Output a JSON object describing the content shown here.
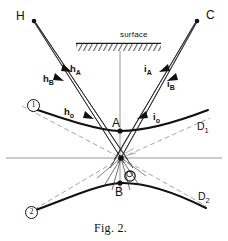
{
  "figure": {
    "caption": "Fig. 2.",
    "surface_label": "surface",
    "points": [
      {
        "id": "H",
        "label": "H",
        "x": 30,
        "y": 17
      },
      {
        "id": "C",
        "label": "C",
        "x": 206,
        "y": 16
      },
      {
        "id": "A",
        "label": "A",
        "x": 121,
        "y": 124
      },
      {
        "id": "B",
        "label": "B",
        "x": 120,
        "y": 191
      },
      {
        "id": "O",
        "label": "O",
        "x": 130,
        "y": 176
      },
      {
        "id": "D1",
        "label": "D",
        "sub": "1",
        "x": 200,
        "y": 128
      },
      {
        "id": "D2",
        "label": "D",
        "sub": "2",
        "x": 201,
        "y": 198
      }
    ],
    "ray_labels": [
      {
        "id": "hA",
        "label": "h",
        "sub": "A",
        "x": 71,
        "y": 71
      },
      {
        "id": "hB",
        "label": "h",
        "sub": "B",
        "x": 45,
        "y": 80
      },
      {
        "id": "ho",
        "label": "h",
        "sub": "o",
        "x": 66,
        "y": 112
      },
      {
        "id": "iA",
        "label": "i",
        "sub": "A",
        "x": 145,
        "y": 71
      },
      {
        "id": "iB",
        "label": "i",
        "sub": "B",
        "x": 168,
        "y": 84
      },
      {
        "id": "io",
        "label": "i",
        "sub": "o",
        "x": 155,
        "y": 117
      }
    ],
    "branch_markers": [
      {
        "id": "branch-1",
        "label": "1",
        "x": 27,
        "y": 101
      },
      {
        "id": "branch-2",
        "label": "2",
        "x": 26,
        "y": 207
      }
    ],
    "colors": {
      "ink": "#111111",
      "ray": "#222222",
      "axis": "#777777",
      "dashed": "#8a8a8a",
      "hatch": "#333333"
    },
    "geometry": {
      "source_H": [
        33,
        21
      ],
      "source_C": [
        198,
        20
      ],
      "vertex_A": [
        120,
        131
      ],
      "vertex_B": [
        120,
        183
      ],
      "focus_O": [
        121,
        158
      ],
      "surface_span_x": [
        76,
        161
      ],
      "surface_y": 43,
      "horizontal_axis_y": 158,
      "normal_x": 120
    }
  }
}
